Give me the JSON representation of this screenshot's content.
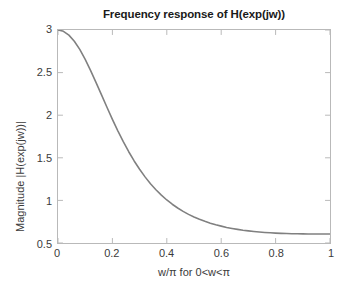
{
  "chart_data": {
    "type": "line",
    "title": "Frequency response of H(exp(jw))",
    "xlabel": "w/π for 0<w<π",
    "ylabel": "Magnitude |H(exp(jw))|",
    "xlim": [
      0,
      1
    ],
    "ylim": [
      0.5,
      3
    ],
    "grid": false,
    "legend": null,
    "line_color": "#808080",
    "axis_color": "#b9b9b9",
    "text_color": "#3b3b3b",
    "background": "#ffffff",
    "xticks": [
      "0",
      "0.2",
      "0.4",
      "0.6",
      "0.8",
      "1"
    ],
    "xtick_values": [
      0,
      0.2,
      0.4,
      0.6,
      0.8,
      1
    ],
    "yticks": [
      "0.5",
      "1",
      "1.5",
      "2",
      "2.5",
      "3"
    ],
    "ytick_values": [
      0.5,
      1,
      1.5,
      2,
      2.5,
      3
    ],
    "series": [
      {
        "name": "|H(exp(jw))|",
        "x": [
          0,
          0.02,
          0.04,
          0.06,
          0.08,
          0.1,
          0.12,
          0.14,
          0.16,
          0.18,
          0.2,
          0.22,
          0.24,
          0.26,
          0.28,
          0.3,
          0.32,
          0.34,
          0.36,
          0.38,
          0.4,
          0.42,
          0.44,
          0.46,
          0.48,
          0.5,
          0.52,
          0.54,
          0.56,
          0.58,
          0.6,
          0.62,
          0.64,
          0.66,
          0.68,
          0.7,
          0.72,
          0.74,
          0.76,
          0.78,
          0.8,
          0.82,
          0.84,
          0.86,
          0.88,
          0.9,
          0.92,
          0.94,
          0.96,
          0.98,
          1
        ],
        "y": [
          3.0,
          2.985,
          2.94,
          2.868,
          2.772,
          2.655,
          2.524,
          2.383,
          2.238,
          2.093,
          1.951,
          1.816,
          1.689,
          1.571,
          1.463,
          1.365,
          1.276,
          1.196,
          1.125,
          1.062,
          1.005,
          0.955,
          0.911,
          0.871,
          0.836,
          0.805,
          0.778,
          0.754,
          0.733,
          0.714,
          0.698,
          0.683,
          0.671,
          0.66,
          0.65,
          0.642,
          0.635,
          0.629,
          0.624,
          0.62,
          0.616,
          0.613,
          0.611,
          0.609,
          0.608,
          0.607,
          0.6065,
          0.606,
          0.6055,
          0.6052,
          0.605
        ]
      }
    ]
  }
}
